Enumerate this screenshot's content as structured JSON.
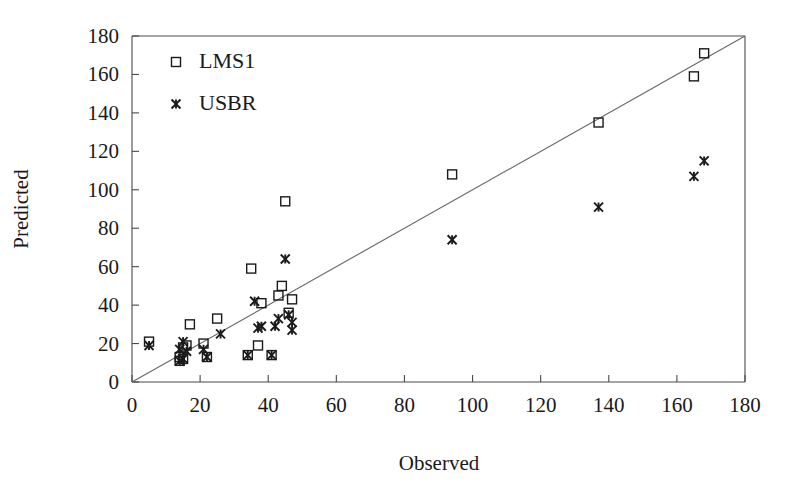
{
  "chart_data": {
    "type": "scatter",
    "title": "",
    "xlabel": "Observed",
    "ylabel": "Predicted",
    "xlim": [
      0,
      180
    ],
    "ylim": [
      0,
      180
    ],
    "xticks": [
      0,
      20,
      40,
      60,
      80,
      100,
      120,
      140,
      160,
      180
    ],
    "yticks": [
      0,
      20,
      40,
      60,
      80,
      100,
      120,
      140,
      160,
      180
    ],
    "grid": false,
    "legend_position": "top-left",
    "reference_line": {
      "name": "1:1 line",
      "from": [
        0,
        0
      ],
      "to": [
        180,
        180
      ]
    },
    "series": [
      {
        "name": "LMS1",
        "marker": "open-square",
        "points": [
          [
            5,
            21
          ],
          [
            14,
            11
          ],
          [
            14,
            13
          ],
          [
            15,
            18
          ],
          [
            15,
            12
          ],
          [
            16,
            19
          ],
          [
            17,
            30
          ],
          [
            21,
            20
          ],
          [
            22,
            13
          ],
          [
            25,
            33
          ],
          [
            34,
            14
          ],
          [
            35,
            59
          ],
          [
            37,
            19
          ],
          [
            38,
            41
          ],
          [
            41,
            14
          ],
          [
            43,
            45
          ],
          [
            44,
            50
          ],
          [
            45,
            94
          ],
          [
            46,
            36
          ],
          [
            47,
            43
          ],
          [
            94,
            108
          ],
          [
            137,
            135
          ],
          [
            165,
            159
          ],
          [
            168,
            171
          ]
        ]
      },
      {
        "name": "USBR",
        "marker": "cross",
        "points": [
          [
            5,
            19
          ],
          [
            14,
            11
          ],
          [
            14,
            17
          ],
          [
            15,
            12
          ],
          [
            15,
            21
          ],
          [
            16,
            16
          ],
          [
            21,
            17
          ],
          [
            22,
            13
          ],
          [
            26,
            25
          ],
          [
            34,
            14
          ],
          [
            36,
            42
          ],
          [
            37,
            28
          ],
          [
            38,
            29
          ],
          [
            41,
            14
          ],
          [
            42,
            29
          ],
          [
            43,
            33
          ],
          [
            45,
            64
          ],
          [
            46,
            35
          ],
          [
            47,
            27
          ],
          [
            47,
            31
          ],
          [
            94,
            74
          ],
          [
            137,
            91
          ],
          [
            165,
            107
          ],
          [
            168,
            115
          ]
        ]
      }
    ]
  },
  "legend": {
    "entries": [
      {
        "label": "LMS1",
        "marker": "open-square"
      },
      {
        "label": "USBR",
        "marker": "cross"
      }
    ]
  },
  "axes": {
    "x": {
      "title": "Observed",
      "tick_labels": [
        "0",
        "20",
        "40",
        "60",
        "80",
        "100",
        "120",
        "140",
        "160",
        "180"
      ]
    },
    "y": {
      "title": "Predicted",
      "tick_labels": [
        "0",
        "20",
        "40",
        "60",
        "80",
        "100",
        "120",
        "140",
        "160",
        "180"
      ]
    }
  },
  "colors": {
    "marker": "#1a1a1a",
    "frame": "#4a4a4a",
    "reference_line": "#666666",
    "background": "#ffffff"
  }
}
